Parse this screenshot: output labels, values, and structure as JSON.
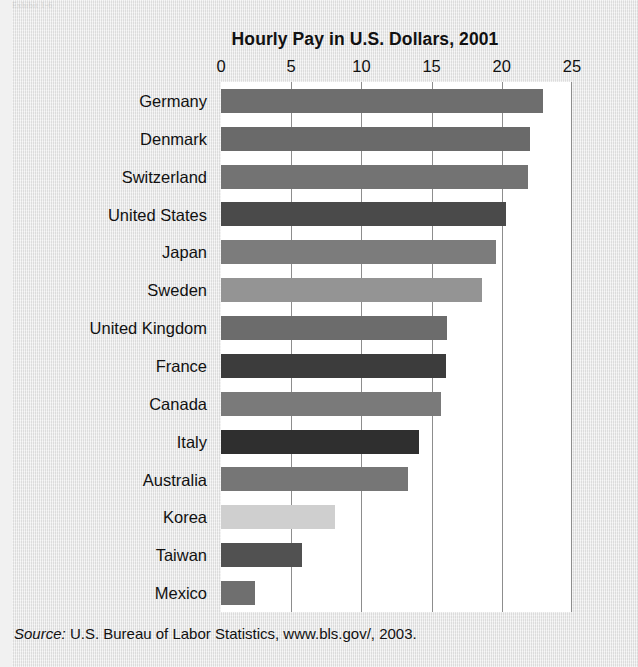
{
  "page": {
    "background_color": "#e9e9e9",
    "plot_background_color": "#ffffff",
    "gridline_color": "#8d8d8d",
    "text_color": "#111111",
    "top_edge_artifact": "Exhibit 1-6"
  },
  "source_note": {
    "label": "Source:",
    "text": "U.S. Bureau of Labor Statistics, www.bls.gov/, 2003."
  },
  "chart_data": {
    "type": "bar",
    "orientation": "horizontal",
    "title": "Hourly Pay in U.S. Dollars, 2001",
    "xlabel": "",
    "ylabel": "",
    "xlim": [
      0,
      25
    ],
    "xticks": [
      0,
      5,
      10,
      15,
      20,
      25
    ],
    "xtick_labels": [
      "0",
      "5",
      "10",
      "15",
      "20",
      "25"
    ],
    "grid": "vertical",
    "legend": "none",
    "units": "U.S. dollars per hour",
    "year": "2001",
    "categories": [
      "Germany",
      "Denmark",
      "Switzerland",
      "United States",
      "Japan",
      "Sweden",
      "United Kingdom",
      "France",
      "Canada",
      "Italy",
      "Australia",
      "Korea",
      "Taiwan",
      "Mexico"
    ],
    "values": [
      22.9,
      22.0,
      21.9,
      20.3,
      19.6,
      18.6,
      16.1,
      16.0,
      15.7,
      14.1,
      13.3,
      8.1,
      5.8,
      2.4
    ],
    "bar_colors": [
      "#6e6e6e",
      "#6a6a6a",
      "#737373",
      "#4a4a4a",
      "#7c7c7c",
      "#949494",
      "#6c6c6c",
      "#3c3c3c",
      "#7a7a7a",
      "#2f2f2f",
      "#767676",
      "#cfcfcf",
      "#515151",
      "#6f6f6f"
    ]
  }
}
